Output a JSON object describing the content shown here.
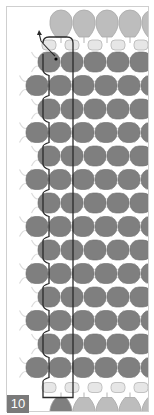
{
  "figure": {
    "step_number": "10",
    "colors": {
      "main_bead": "#7f7f7f",
      "main_bead_stroke": "#6c6c6c",
      "drop_bead": "#bdbdbd",
      "drop_bead_stroke": "#a8a8a8",
      "small_bead": "#e6e6e6",
      "small_bead_stroke": "#b5b5b5",
      "thread_path": "#2a2a2a",
      "ghost_thread": "#dcdcdc",
      "frame": "#cfcfcf",
      "badge_bg": "#7a7a7a",
      "badge_text": "#ffffff"
    },
    "layout": {
      "rows": 14,
      "row_spacing": 23.5,
      "first_row_y": 61,
      "odd_row_start_x": 48,
      "even_row_start_x": 36,
      "bead_pitch": 23
    },
    "annotations": {
      "thread_start_marker": "arrow",
      "needle_entry_dot": "dot"
    }
  }
}
